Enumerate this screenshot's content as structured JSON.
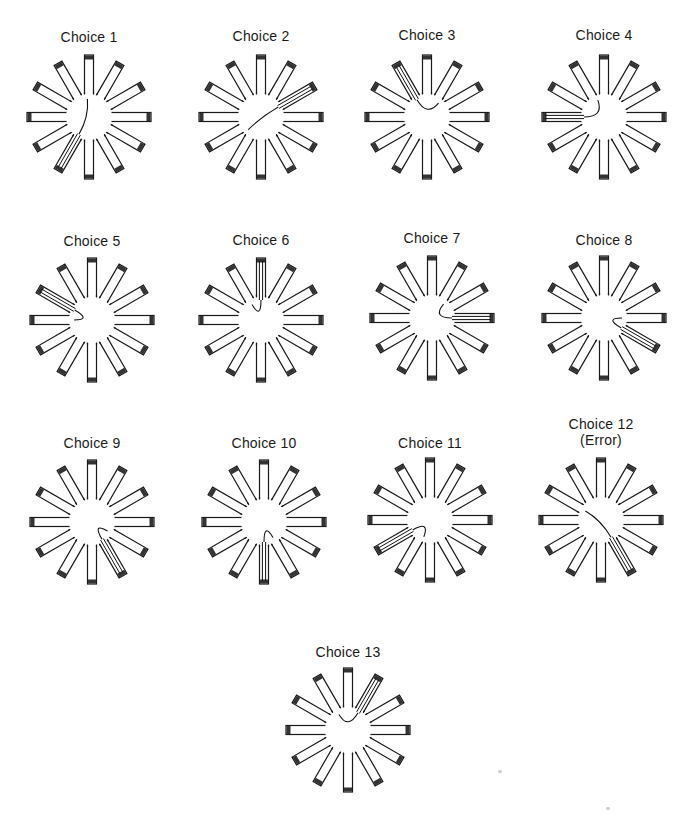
{
  "figure": {
    "arm_count": 12,
    "colors": {
      "stroke": "#1a1a1a",
      "arm_fill": "#ffffff",
      "food_cup": "#333333",
      "path": "#111111"
    }
  },
  "panels": [
    {
      "label": "Choice 1",
      "sublabel": "",
      "cx": 89,
      "cy": 117,
      "label_y": 29,
      "arm": 7,
      "path": "c1"
    },
    {
      "label": "Choice 2",
      "sublabel": "",
      "cx": 261,
      "cy": 117,
      "label_y": 28,
      "arm": 2,
      "path": "c2"
    },
    {
      "label": "Choice 3",
      "sublabel": "",
      "cx": 427,
      "cy": 117,
      "label_y": 27,
      "arm": 11,
      "path": "c3"
    },
    {
      "label": "Choice 4",
      "sublabel": "",
      "cx": 604,
      "cy": 117,
      "label_y": 27,
      "arm": 9,
      "path": "c4"
    },
    {
      "label": "Choice 5",
      "sublabel": "",
      "cx": 92,
      "cy": 320,
      "label_y": 233,
      "arm": 10,
      "path": "c5"
    },
    {
      "label": "Choice 6",
      "sublabel": "",
      "cx": 261,
      "cy": 320,
      "label_y": 232,
      "arm": 0,
      "path": "c6"
    },
    {
      "label": "Choice 7",
      "sublabel": "",
      "cx": 432,
      "cy": 318,
      "label_y": 230,
      "arm": 3,
      "path": "c7"
    },
    {
      "label": "Choice 8",
      "sublabel": "",
      "cx": 604,
      "cy": 318,
      "label_y": 232,
      "arm": 4,
      "path": "c8"
    },
    {
      "label": "Choice 9",
      "sublabel": "",
      "cx": 92,
      "cy": 522,
      "label_y": 435,
      "arm": 5,
      "path": "c9"
    },
    {
      "label": "Choice 10",
      "sublabel": "",
      "cx": 264,
      "cy": 522,
      "label_y": 435,
      "arm": 6,
      "path": "c10"
    },
    {
      "label": "Choice 11",
      "sublabel": "",
      "cx": 430,
      "cy": 520,
      "label_y": 435,
      "arm": 8,
      "path": "c11"
    },
    {
      "label": "Choice 12",
      "sublabel": "(Error)",
      "cx": 601,
      "cy": 520,
      "label_y": 416,
      "arm": 5,
      "path": "c12"
    },
    {
      "label": "Choice 13",
      "sublabel": "",
      "cx": 348,
      "cy": 730,
      "label_y": 644,
      "arm": 1,
      "path": "c13"
    }
  ]
}
